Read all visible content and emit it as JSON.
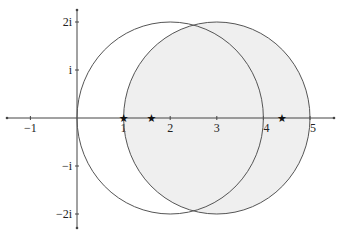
{
  "diagram": {
    "type": "complex-plane",
    "title": "",
    "real_axis": {
      "range": [
        -1.6,
        5.6
      ],
      "ticks": [
        {
          "value": -1,
          "label": "−1"
        },
        {
          "value": 1,
          "label": "1"
        },
        {
          "value": 2,
          "label": "2"
        },
        {
          "value": 3,
          "label": "3"
        },
        {
          "value": 4,
          "label": "4"
        },
        {
          "value": 5,
          "label": "5"
        }
      ]
    },
    "imag_axis": {
      "range": [
        -2.3,
        2.3
      ],
      "ticks": [
        {
          "value": 2,
          "label": "2i"
        },
        {
          "value": 1,
          "label": "i"
        },
        {
          "value": -1,
          "label": "−i"
        },
        {
          "value": -2,
          "label": "−2i"
        }
      ]
    },
    "circles": [
      {
        "name": "circle-center-2",
        "center": [
          2,
          0
        ],
        "radius": 2,
        "fill": "none",
        "stroke": "#555555"
      },
      {
        "name": "circle-center-3",
        "center": [
          3,
          0
        ],
        "radius": 2,
        "fill": "#efefef",
        "stroke": "#555555"
      }
    ],
    "points": [
      {
        "name": "star-1",
        "x": 1.0,
        "y": 0,
        "marker": "★"
      },
      {
        "name": "star-2",
        "x": 1.6,
        "y": 0,
        "marker": "★"
      },
      {
        "name": "star-3",
        "x": 4.4,
        "y": 0,
        "marker": "★"
      }
    ],
    "colors": {
      "axis": "#444444",
      "circle_stroke": "#555555",
      "shade": "#efefef",
      "marker": "#111111"
    }
  }
}
